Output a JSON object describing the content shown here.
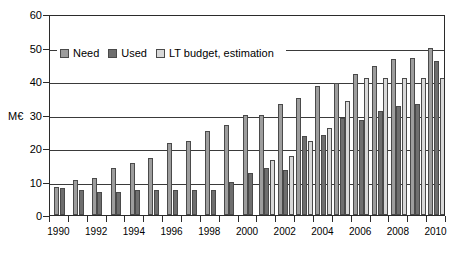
{
  "chart_data": {
    "type": "bar",
    "title": "",
    "xlabel": "",
    "ylabel": "M€",
    "ylim": [
      0,
      60
    ],
    "ytick_values": [
      0,
      10,
      20,
      30,
      40,
      50,
      60
    ],
    "ytick_labels": [
      "0",
      "10",
      "20",
      "30",
      "40",
      "50",
      "60"
    ],
    "grid": true,
    "grid_axis": "y",
    "legend_position": "upper-left-inside",
    "categories": [
      "1990",
      "1991",
      "1992",
      "1993",
      "1994",
      "1995",
      "1996",
      "1997",
      "1998",
      "1999",
      "2000",
      "2001",
      "2002",
      "2003",
      "2004",
      "2005",
      "2006",
      "2007",
      "2008",
      "2009",
      "2010"
    ],
    "xtick_labels": [
      "1990",
      "1992",
      "1994",
      "1996",
      "1998",
      "2000",
      "2002",
      "2004",
      "2006",
      "2008",
      "2010"
    ],
    "series": [
      {
        "name": "Need",
        "color": "#9d9d9d",
        "values": [
          8.5,
          10.5,
          11,
          14,
          15.5,
          17,
          21.5,
          22,
          25,
          27,
          30,
          30,
          33,
          35,
          38.5,
          39.5,
          42,
          44.5,
          46.5,
          47,
          50
        ]
      },
      {
        "name": "Used",
        "color": "#6e6e6e",
        "values": [
          8,
          7.5,
          7,
          7,
          7.5,
          7.5,
          7.5,
          7.5,
          7.5,
          10,
          12.5,
          14,
          13.5,
          23.5,
          24,
          29,
          28.5,
          31,
          32.5,
          33,
          46
        ]
      },
      {
        "name": "LT budget, estimation",
        "color": "#d8d8d8",
        "values": [
          null,
          null,
          null,
          null,
          null,
          null,
          null,
          null,
          null,
          null,
          null,
          16.5,
          17.5,
          22,
          26,
          34,
          41,
          41,
          41,
          41,
          41
        ]
      }
    ]
  },
  "legend": {
    "items": [
      {
        "label": "Need"
      },
      {
        "label": "Used"
      },
      {
        "label": "LT budget, estimation"
      }
    ]
  }
}
